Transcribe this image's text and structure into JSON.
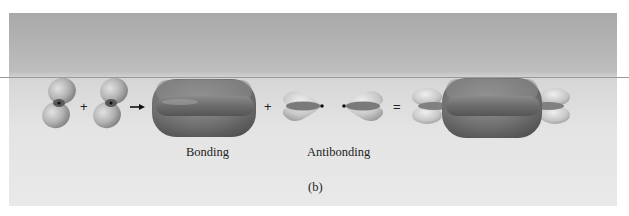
{
  "figure": {
    "panel_label": "(b)",
    "labels": {
      "bonding": "Bonding",
      "antibonding": "Antibonding"
    },
    "operators": {
      "plus_1": "+",
      "arrow": "→",
      "plus_2": "+",
      "equals": "="
    },
    "components": [
      {
        "name": "p-orbital-atom-1",
        "type": "p-orbital"
      },
      {
        "name": "p-orbital-atom-2",
        "type": "p-orbital"
      },
      {
        "name": "bonding-pi-orbital",
        "type": "bonding"
      },
      {
        "name": "antibonding-lobe-left",
        "type": "antibonding"
      },
      {
        "name": "antibonding-lobe-right",
        "type": "antibonding"
      },
      {
        "name": "combined-orbitals",
        "type": "sum"
      }
    ],
    "colors": {
      "lobe_dark": "#6e6e6e",
      "lobe_light": "#b8b8b8",
      "background_top": "#a9a9a9",
      "background_bottom": "#e9e9e9"
    }
  }
}
